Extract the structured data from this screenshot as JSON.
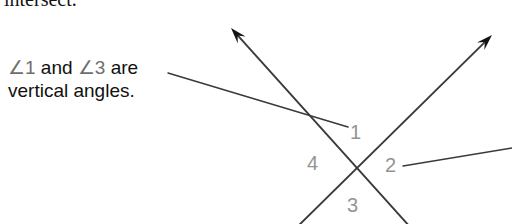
{
  "figure": {
    "heading_clipped": "intersect.",
    "callout": {
      "line1_prefix": "∠1",
      "line1_mid": " and ",
      "line1_suffix": "∠3",
      "line1_tail": " are",
      "line2": "vertical angles."
    },
    "angle_labels": {
      "one": "1",
      "two": "2",
      "three": "3",
      "four": "4"
    },
    "colors": {
      "ink": "#141414",
      "line": "#3a3a3a",
      "label_gray": "#949494",
      "angle_symbol_gray": "#6e6e6e",
      "background": "#ffffff"
    },
    "geometry": {
      "vertex_x": 357,
      "vertex_y": 168,
      "ray_a_tip_x": 231,
      "ray_a_tip_y": 28,
      "ray_b_tip_x": 492,
      "ray_b_tip_y": 35,
      "leader_left_start_x": 168,
      "leader_left_start_y": 73,
      "leader_left_end_x": 348,
      "leader_left_end_y": 127,
      "leader_right_start_x": 403,
      "leader_right_start_y": 166,
      "leader_right_end_x": 512,
      "leader_right_end_y": 148
    }
  }
}
